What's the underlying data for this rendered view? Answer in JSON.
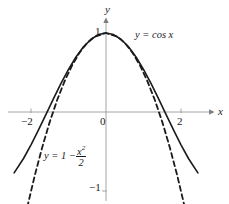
{
  "figure": {
    "background": "#ffffff",
    "width": 229,
    "height": 204
  },
  "axes": {
    "x_label": "x",
    "y_label": "y",
    "axis_color": "#9a9a9a",
    "origin_px": [
      106,
      112
    ],
    "px_per_x_unit": 37.5,
    "px_per_y_unit": 79,
    "x_ticks": [
      {
        "value": -2,
        "label": "−2"
      },
      {
        "value": 0,
        "label": "0"
      },
      {
        "value": 2,
        "label": "2"
      }
    ],
    "y_ticks": [
      {
        "value": 1,
        "label": "1"
      },
      {
        "value": -1,
        "label": "−1"
      }
    ]
  },
  "labels": {
    "cos_label": "y = cos x",
    "parabola_label_prefix": "y = 1 −",
    "parabola_numerator": "x",
    "parabola_exponent": "2",
    "parabola_denominator": "2"
  },
  "chart_data": {
    "type": "line",
    "title": "",
    "xlabel": "x",
    "ylabel": "y",
    "xlim": [
      -2.6,
      2.6
    ],
    "ylim": [
      -1.25,
      1.15
    ],
    "grid": false,
    "legend": "inline-annotations",
    "x_ticks": [
      -2,
      0,
      2
    ],
    "y_ticks": [
      1,
      -1
    ],
    "series": [
      {
        "name": "y = cos x",
        "style": "solid",
        "color": "#1a1a1a",
        "width": 1.6,
        "formula": "cos(x)",
        "x_range": [
          -2.45,
          2.45
        ],
        "points": [
          {
            "x": -2.45,
            "y": -0.7702
          },
          {
            "x": -2.2,
            "y": -0.5885
          },
          {
            "x": -2.0,
            "y": -0.4161
          },
          {
            "x": -1.8,
            "y": -0.2272
          },
          {
            "x": -1.6,
            "y": -0.0292
          },
          {
            "x": -1.4,
            "y": 0.17
          },
          {
            "x": -1.2,
            "y": 0.3624
          },
          {
            "x": -1.0,
            "y": 0.5403
          },
          {
            "x": -0.8,
            "y": 0.6967
          },
          {
            "x": -0.6,
            "y": 0.8253
          },
          {
            "x": -0.4,
            "y": 0.9211
          },
          {
            "x": -0.2,
            "y": 0.9801
          },
          {
            "x": 0.0,
            "y": 1.0
          },
          {
            "x": 0.2,
            "y": 0.9801
          },
          {
            "x": 0.4,
            "y": 0.9211
          },
          {
            "x": 0.6,
            "y": 0.8253
          },
          {
            "x": 0.8,
            "y": 0.6967
          },
          {
            "x": 1.0,
            "y": 0.5403
          },
          {
            "x": 1.2,
            "y": 0.3624
          },
          {
            "x": 1.4,
            "y": 0.17
          },
          {
            "x": 1.6,
            "y": -0.0292
          },
          {
            "x": 1.8,
            "y": -0.2272
          },
          {
            "x": 2.0,
            "y": -0.4161
          },
          {
            "x": 2.2,
            "y": -0.5885
          },
          {
            "x": 2.45,
            "y": -0.7702
          }
        ]
      },
      {
        "name": "y = 1 - x^2/2",
        "style": "dashed",
        "color": "#1a1a1a",
        "width": 1.8,
        "dasharray": "5,3.5",
        "formula": "1 - x*x/2",
        "x_range": [
          -2.1,
          2.1
        ],
        "points": [
          {
            "x": -2.1,
            "y": -1.205
          },
          {
            "x": -1.9,
            "y": -0.805
          },
          {
            "x": -1.7,
            "y": -0.445
          },
          {
            "x": -1.5,
            "y": -0.125
          },
          {
            "x": -1.3,
            "y": 0.155
          },
          {
            "x": -1.1,
            "y": 0.395
          },
          {
            "x": -0.9,
            "y": 0.595
          },
          {
            "x": -0.7,
            "y": 0.755
          },
          {
            "x": -0.5,
            "y": 0.875
          },
          {
            "x": -0.3,
            "y": 0.955
          },
          {
            "x": 0.0,
            "y": 1.0
          },
          {
            "x": 0.3,
            "y": 0.955
          },
          {
            "x": 0.5,
            "y": 0.875
          },
          {
            "x": 0.7,
            "y": 0.755
          },
          {
            "x": 0.9,
            "y": 0.595
          },
          {
            "x": 1.1,
            "y": 0.395
          },
          {
            "x": 1.3,
            "y": 0.155
          },
          {
            "x": 1.5,
            "y": -0.125
          },
          {
            "x": 1.7,
            "y": -0.445
          },
          {
            "x": 1.9,
            "y": -0.805
          },
          {
            "x": 2.1,
            "y": -1.205
          }
        ]
      }
    ],
    "annotations": [
      {
        "text": "y = cos x",
        "x": 0.82,
        "y": 1.0
      },
      {
        "text": "y = 1 - x^2/2",
        "x": -1.55,
        "y": -0.46
      }
    ]
  }
}
